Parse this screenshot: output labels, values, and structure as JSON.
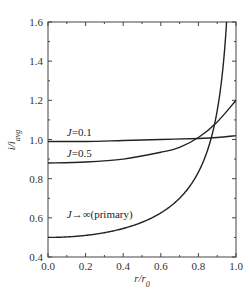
{
  "chart_data": {
    "type": "line",
    "title": "",
    "xlabel": "r/r0",
    "ylabel": "i/i_avg",
    "xlim": [
      0.0,
      1.0
    ],
    "ylim": [
      0.4,
      1.6
    ],
    "xticks": [
      0.0,
      0.2,
      0.4,
      0.6,
      0.8,
      1.0
    ],
    "xtick_labels": [
      "0.0",
      "0.2",
      "0.4",
      "0.6",
      "0.8",
      "1.0"
    ],
    "yticks": [
      0.4,
      0.6,
      0.8,
      1.0,
      1.2,
      1.4,
      1.6
    ],
    "ytick_labels": [
      "0.4",
      "0.6",
      "0.8",
      "1.0",
      "1.2",
      "1.4",
      "1.6"
    ],
    "grid": false,
    "legend": "inline labels",
    "series": [
      {
        "name": "J=0.1",
        "x": [
          0.0,
          0.2,
          0.4,
          0.6,
          0.8,
          0.9,
          1.0
        ],
        "y": [
          0.99,
          0.99,
          0.995,
          1.0,
          1.005,
          1.01,
          1.02
        ],
        "label_pos": [
          0.1,
          1.02
        ]
      },
      {
        "name": "J=0.5",
        "x": [
          0.0,
          0.2,
          0.4,
          0.6,
          0.7,
          0.8,
          0.9,
          1.0
        ],
        "y": [
          0.88,
          0.885,
          0.9,
          0.935,
          0.96,
          1.01,
          1.09,
          1.2
        ],
        "label_pos": [
          0.1,
          0.91
        ]
      },
      {
        "name": "J→∞(primary)",
        "x": [
          0.0,
          0.2,
          0.4,
          0.5,
          0.6,
          0.7,
          0.8,
          0.85,
          0.9,
          0.93,
          0.95
        ],
        "y": [
          0.5,
          0.51,
          0.546,
          0.577,
          0.625,
          0.7,
          0.833,
          0.949,
          1.147,
          1.36,
          1.6
        ],
        "label_pos": [
          0.1,
          0.6
        ]
      }
    ]
  },
  "labels": {
    "xlabel_main": "r/r",
    "xlabel_sub": "0",
    "ylabel_main": "i/i",
    "ylabel_sub": "avg"
  }
}
